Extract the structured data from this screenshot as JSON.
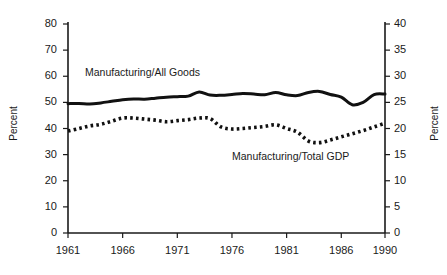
{
  "chart_data": {
    "type": "line",
    "title": "",
    "xlabel": "",
    "ylabel": "Percent",
    "ylabel_right": "Percent",
    "xlim": [
      1961,
      1990
    ],
    "ylim": [
      0,
      80
    ],
    "ylim_right": [
      0,
      40
    ],
    "grid": false,
    "legend_position": "inline-annotations",
    "x_ticks": [
      "1961",
      "1966",
      "1971",
      "1976",
      "1981",
      "1986",
      "1990"
    ],
    "x_tick_values": [
      1961,
      1966,
      1971,
      1976,
      1981,
      1986,
      1990
    ],
    "y_ticks_left": [
      "0",
      "10",
      "20",
      "30",
      "40",
      "50",
      "60",
      "70",
      "80"
    ],
    "y_tick_values_left": [
      0,
      10,
      20,
      30,
      40,
      50,
      60,
      70,
      80
    ],
    "y_ticks_right": [
      "0",
      "5",
      "10",
      "15",
      "20",
      "25",
      "30",
      "35",
      "40"
    ],
    "y_tick_values_right": [
      0,
      5,
      10,
      15,
      20,
      25,
      30,
      35,
      40
    ],
    "x": [
      1961,
      1962,
      1963,
      1964,
      1965,
      1966,
      1967,
      1968,
      1969,
      1970,
      1971,
      1972,
      1973,
      1974,
      1975,
      1976,
      1977,
      1978,
      1979,
      1980,
      1981,
      1982,
      1983,
      1984,
      1985,
      1986,
      1987,
      1988,
      1989,
      1990
    ],
    "series": [
      {
        "name": "Manufacturing/All Goods",
        "axis": "left",
        "style": "solid",
        "color": "#111111",
        "values": [
          49.5,
          49.6,
          49.4,
          49.8,
          50.4,
          51.0,
          51.3,
          51.2,
          51.6,
          52.0,
          52.2,
          52.4,
          54.0,
          52.8,
          52.7,
          53.0,
          53.4,
          53.2,
          52.9,
          53.8,
          52.9,
          52.6,
          53.8,
          54.2,
          53.0,
          52.0,
          49.1,
          50.0,
          53.0,
          53.2
        ]
      },
      {
        "name": "Manufacturing/Total GDP",
        "axis": "right",
        "style": "dotted",
        "color": "#111111",
        "values": [
          19.5,
          20.0,
          20.5,
          20.8,
          21.4,
          22.0,
          22.0,
          21.8,
          21.6,
          21.3,
          21.5,
          21.7,
          22.0,
          21.9,
          20.3,
          19.9,
          20.0,
          20.2,
          20.4,
          20.7,
          20.0,
          19.3,
          17.6,
          17.3,
          17.8,
          18.4,
          19.0,
          19.6,
          20.3,
          21.0
        ]
      }
    ],
    "annotations": [
      {
        "text": "Manufacturing/All Goods",
        "x": 1962.5,
        "y": 60
      },
      {
        "text": "Manufacturing/Total GDP",
        "x": 1977.5,
        "y": 33
      }
    ]
  }
}
